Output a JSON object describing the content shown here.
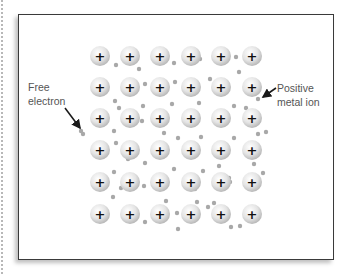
{
  "diagram": {
    "labels": {
      "free_electron_line1": "Free",
      "free_electron_line2": "electron",
      "positive_ion_line1": "Positive",
      "positive_ion_line2": "metal ion"
    },
    "ion_symbol": "+",
    "ion_grid": {
      "columns_x": [
        100,
        130,
        160,
        191,
        221,
        252
      ],
      "rows_y": [
        56,
        87,
        118,
        150,
        182,
        214
      ],
      "radius": 10
    },
    "electrons": [
      [
        116,
        65
      ],
      [
        139,
        69
      ],
      [
        174,
        63
      ],
      [
        200,
        59
      ],
      [
        236,
        57
      ],
      [
        115,
        101
      ],
      [
        145,
        84
      ],
      [
        175,
        82
      ],
      [
        210,
        79
      ],
      [
        239,
        72
      ],
      [
        258,
        99
      ],
      [
        119,
        108
      ],
      [
        143,
        106
      ],
      [
        172,
        104
      ],
      [
        199,
        103
      ],
      [
        234,
        106
      ],
      [
        246,
        108
      ],
      [
        81,
        131
      ],
      [
        114,
        131
      ],
      [
        142,
        121
      ],
      [
        164,
        133
      ],
      [
        178,
        138
      ],
      [
        201,
        137
      ],
      [
        234,
        138
      ],
      [
        258,
        134
      ],
      [
        266,
        132
      ],
      [
        83,
        134
      ],
      [
        116,
        143
      ],
      [
        128,
        159
      ],
      [
        145,
        163
      ],
      [
        174,
        169
      ],
      [
        203,
        171
      ],
      [
        219,
        166
      ],
      [
        229,
        178
      ],
      [
        254,
        164
      ],
      [
        114,
        172
      ],
      [
        121,
        188
      ],
      [
        144,
        186
      ],
      [
        166,
        185
      ],
      [
        195,
        189
      ],
      [
        230,
        182
      ],
      [
        263,
        173
      ],
      [
        113,
        197
      ],
      [
        126,
        213
      ],
      [
        166,
        201
      ],
      [
        177,
        213
      ],
      [
        197,
        202
      ],
      [
        208,
        207
      ],
      [
        214,
        203
      ],
      [
        145,
        222
      ],
      [
        231,
        227
      ],
      [
        240,
        226
      ],
      [
        178,
        229
      ]
    ],
    "colors": {
      "frame_border": "#3a3a3a",
      "ion_fill": "#e6e6e6",
      "ion_shade": "#bdbdbd",
      "electron": "#a8a8a8",
      "label_text": "#555555",
      "arrow": "#1a1a1a"
    }
  }
}
